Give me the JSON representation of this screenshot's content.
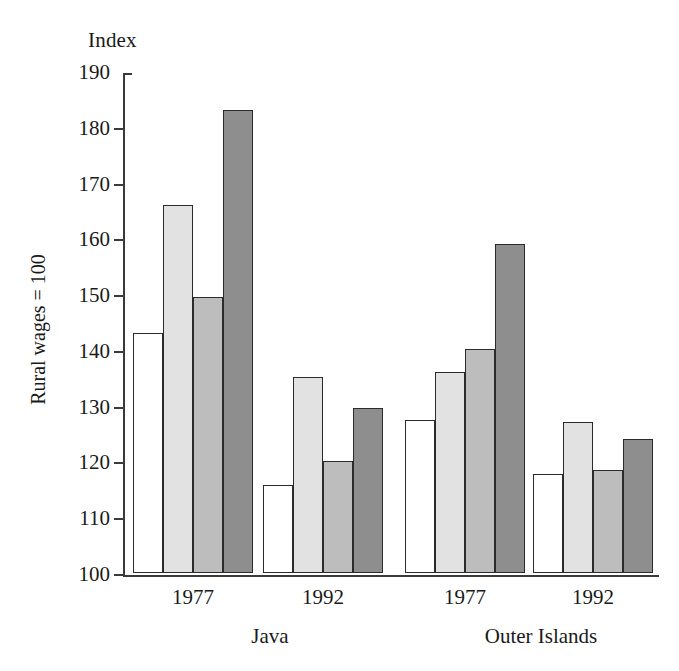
{
  "chart_data": {
    "type": "bar",
    "title": "",
    "top_axis_label": "Index",
    "ylabel": "Rural wages = 100",
    "xlabel": "",
    "ylim": [
      100,
      190
    ],
    "ytick_step": 10,
    "yticks": [
      100,
      110,
      120,
      130,
      140,
      150,
      160,
      170,
      180,
      190
    ],
    "ytick_labels": [
      "100",
      "110",
      "120",
      "130",
      "140",
      "150",
      "160",
      "170",
      "180",
      "190"
    ],
    "grid": false,
    "legend": "none",
    "group_labels": [
      "1977",
      "1992",
      "1977",
      "1992"
    ],
    "region_labels": [
      "Java",
      "Outer Islands"
    ],
    "categories": [
      "Java 1977",
      "Java 1992",
      "Outer Islands 1977",
      "Outer Islands 1992"
    ],
    "series": [
      {
        "name": "Series 1",
        "fill": "white",
        "color": "#ffffff",
        "values": [
          143.0,
          115.8,
          127.5,
          117.8
        ]
      },
      {
        "name": "Series 2",
        "fill": "light-gray",
        "color": "#e2e2e2",
        "values": [
          166.0,
          135.1,
          136.0,
          127.0
        ]
      },
      {
        "name": "Series 3",
        "fill": "mid-gray",
        "color": "#bdbdbd",
        "values": [
          149.4,
          120.0,
          140.2,
          118.5
        ]
      },
      {
        "name": "Series 4",
        "fill": "dark-gray",
        "color": "#8e8e8e",
        "values": [
          183.0,
          129.6,
          159.0,
          124.0
        ]
      }
    ],
    "groups": [
      {
        "region": "Java",
        "period": "1977",
        "bars": [
          143.0,
          166.0,
          149.4,
          183.0
        ]
      },
      {
        "region": "Java",
        "period": "1992",
        "bars": [
          115.8,
          135.1,
          120.0,
          129.6
        ]
      },
      {
        "region": "Outer Islands",
        "period": "1977",
        "bars": [
          127.5,
          136.0,
          140.2,
          159.0
        ]
      },
      {
        "region": "Outer Islands",
        "period": "1992",
        "bars": [
          117.8,
          127.0,
          118.5,
          124.0
        ]
      }
    ]
  }
}
